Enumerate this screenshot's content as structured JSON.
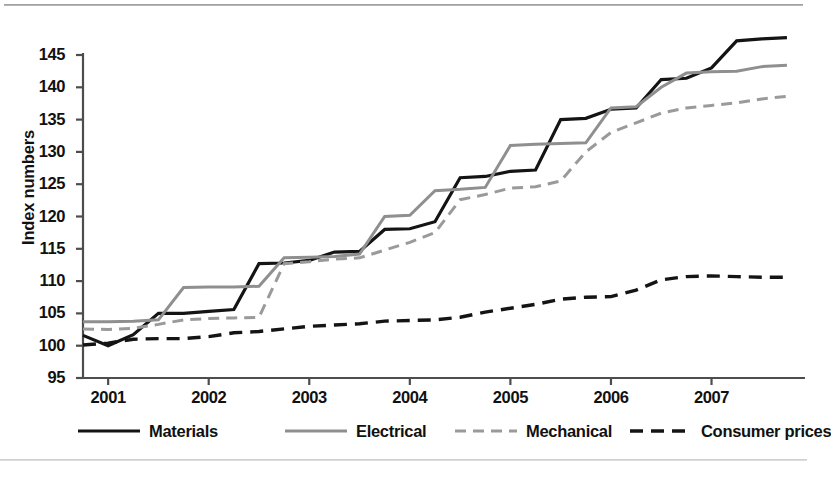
{
  "figure": {
    "ylabel": "Index numbers",
    "ytick_labels": [
      "145",
      "140",
      "135",
      "130",
      "125",
      "120",
      "115",
      "110",
      "105",
      "100",
      "95"
    ],
    "xtick_labels": [
      "2001",
      "2002",
      "2003",
      "2004",
      "2005",
      "2006",
      "2007"
    ]
  },
  "colors": {
    "materials": "#141414",
    "electrical": "#8f8f8f",
    "mechanical": "#9a9a9a",
    "consumer_prices": "#141414",
    "axis": "#4d4d4d",
    "background": "#ffffff"
  },
  "legend": [
    {
      "label": "Materials",
      "style": "solid",
      "color": "#141414",
      "width": 3.2
    },
    {
      "label": "Electrical",
      "style": "solid",
      "color": "#8f8f8f",
      "width": 3.0
    },
    {
      "label": "Mechanical",
      "style": "dashed",
      "color": "#9a9a9a",
      "width": 3.0
    },
    {
      "label": "Consumer prices",
      "style": "dashed",
      "color": "#141414",
      "width": 3.4
    }
  ],
  "chart_data": {
    "type": "line",
    "title": "",
    "xlabel": "",
    "ylabel": "Index numbers",
    "xlim": [
      2000.75,
      2007.85
    ],
    "ylim": [
      95,
      148
    ],
    "yticks": [
      95,
      100,
      105,
      110,
      115,
      120,
      125,
      130,
      135,
      140,
      145
    ],
    "xticks": [
      2001,
      2002,
      2003,
      2004,
      2005,
      2006,
      2007
    ],
    "grid": false,
    "legend_position": "below",
    "x": [
      2000.75,
      2001.0,
      2001.25,
      2001.5,
      2001.75,
      2002.0,
      2002.25,
      2002.5,
      2002.75,
      2003.0,
      2003.25,
      2003.5,
      2003.75,
      2004.0,
      2004.25,
      2004.5,
      2004.75,
      2005.0,
      2005.25,
      2005.5,
      2005.75,
      2006.0,
      2006.25,
      2006.5,
      2006.75,
      2007.0,
      2007.25,
      2007.5,
      2007.75
    ],
    "series": [
      {
        "name": "Materials",
        "style": "solid",
        "color": "#141414",
        "values": [
          101.6,
          100.0,
          101.7,
          105.0,
          105.0,
          105.3,
          105.6,
          112.7,
          112.8,
          113.2,
          114.5,
          114.6,
          118.0,
          118.1,
          119.2,
          126.0,
          126.2,
          127.0,
          127.2,
          135.0,
          135.2,
          136.6,
          136.8,
          141.2,
          141.4,
          143.0,
          147.2,
          147.5,
          147.7
        ]
      },
      {
        "name": "Electrical",
        "style": "solid",
        "color": "#8f8f8f",
        "values": [
          103.7,
          103.7,
          103.8,
          104.0,
          109.0,
          109.1,
          109.1,
          109.2,
          113.6,
          113.7,
          113.8,
          114.2,
          120.0,
          120.2,
          124.0,
          124.2,
          124.5,
          131.0,
          131.2,
          131.3,
          131.4,
          136.8,
          137.0,
          140.0,
          142.2,
          142.4,
          142.5,
          143.2,
          143.4
        ]
      },
      {
        "name": "Mechanical",
        "style": "dashed",
        "color": "#9a9a9a",
        "values": [
          102.6,
          102.5,
          102.7,
          103.3,
          104.0,
          104.2,
          104.3,
          104.4,
          112.7,
          113.0,
          113.4,
          113.6,
          114.8,
          116.0,
          117.5,
          122.6,
          123.4,
          124.4,
          124.6,
          125.5,
          130.0,
          133.0,
          134.5,
          136.0,
          136.8,
          137.2,
          137.6,
          138.2,
          138.6
        ]
      },
      {
        "name": "Consumer prices",
        "style": "dashed",
        "color": "#141414",
        "values": [
          100.1,
          100.4,
          101.0,
          101.1,
          101.1,
          101.4,
          102.0,
          102.2,
          102.6,
          103.0,
          103.2,
          103.4,
          103.8,
          103.9,
          104.0,
          104.4,
          105.2,
          105.8,
          106.4,
          107.2,
          107.5,
          107.6,
          108.6,
          110.2,
          110.7,
          110.8,
          110.7,
          110.6,
          110.6
        ]
      }
    ]
  }
}
